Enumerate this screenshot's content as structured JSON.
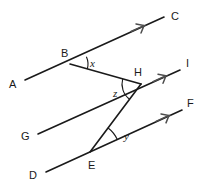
{
  "figure": {
    "type": "geometry-diagram",
    "width": 209,
    "height": 193,
    "background_color": "#ffffff",
    "stroke_color": "#1a1a1a",
    "arrow_color": "#4d4d4d"
  },
  "lines": [
    {
      "name": "line-AC",
      "from_label": "A",
      "to_label": "C",
      "x1": 25,
      "y1": 80,
      "x2": 164,
      "y2": 17,
      "arrow_marker": {
        "x": 138,
        "y": 28.8,
        "label": "parallel-arrow-1"
      }
    },
    {
      "name": "line-GI",
      "from_label": "G",
      "to_label": "I",
      "x1": 38,
      "y1": 134,
      "x2": 180,
      "y2": 70,
      "arrow_marker": {
        "x": 160,
        "y": 78.9,
        "label": "parallel-arrow-2"
      }
    },
    {
      "name": "line-DF",
      "from_label": "D",
      "to_label": "F",
      "x1": 46,
      "y1": 172,
      "x2": 182,
      "y2": 110,
      "arrow_marker": {
        "x": 163,
        "y": 118.6,
        "label": "parallel-arrow-3"
      }
    }
  ],
  "segments": [
    {
      "name": "segment-BH",
      "from_label": "B",
      "to_label": "H",
      "x1": 70,
      "y1": 64,
      "x2": 141,
      "y2": 84
    },
    {
      "name": "segment-HE",
      "from_label": "H",
      "to_label": "E",
      "x1": 141,
      "y1": 84,
      "x2": 90,
      "y2": 152
    }
  ],
  "points": [
    {
      "name": "point-A",
      "label": "A",
      "label_x": 9,
      "label_y": 79
    },
    {
      "name": "point-C",
      "label": "C",
      "label_x": 171,
      "label_y": 11
    },
    {
      "name": "point-B",
      "label": "B",
      "label_x": 61,
      "label_y": 48
    },
    {
      "name": "point-H",
      "label": "H",
      "label_x": 134,
      "label_y": 67
    },
    {
      "name": "point-I",
      "label": "I",
      "label_x": 186,
      "label_y": 58
    },
    {
      "name": "point-G",
      "label": "G",
      "label_x": 21,
      "label_y": 131
    },
    {
      "name": "point-F",
      "label": "F",
      "label_x": 187,
      "label_y": 98
    },
    {
      "name": "point-E",
      "label": "E",
      "label_x": 88,
      "label_y": 160
    },
    {
      "name": "point-D",
      "label": "D",
      "label_x": 29,
      "label_y": 170
    }
  ],
  "angles": [
    {
      "name": "angle-x",
      "label": "x",
      "vertex": "B",
      "label_x": 90,
      "label_y": 58,
      "arc": {
        "cx": 70,
        "cy": 64,
        "r": 18,
        "start_deg": -24,
        "end_deg": 16
      }
    },
    {
      "name": "angle-z",
      "label": "z",
      "vertex": "H",
      "label_x": 113,
      "label_y": 88,
      "arc": {
        "cx": 141,
        "cy": 84,
        "r": 19,
        "start_deg": 164,
        "end_deg": 127
      }
    },
    {
      "name": "angle-y",
      "label": "y",
      "vertex": "E",
      "label_x": 124,
      "label_y": 131,
      "arc": {
        "cx": 90,
        "cy": 152,
        "r": 30,
        "start_deg": -53,
        "end_deg": -25
      }
    }
  ]
}
